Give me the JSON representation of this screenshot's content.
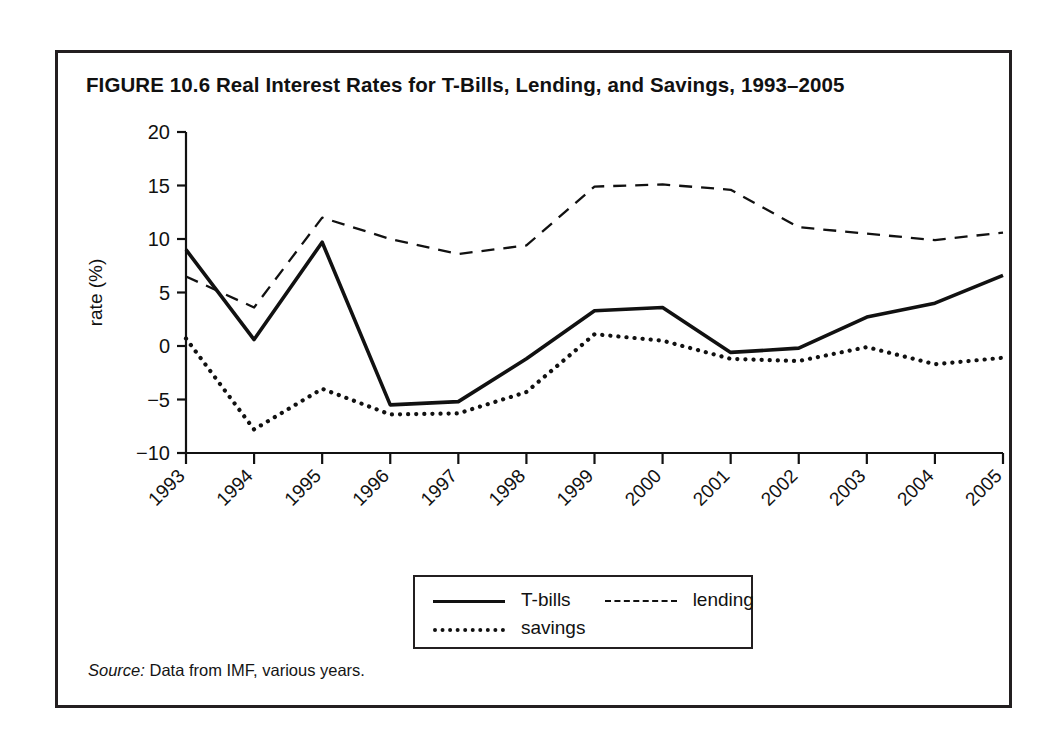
{
  "figure": {
    "title": "FIGURE 10.6  Real Interest Rates for T-Bills, Lending, and Savings, 1993–2005",
    "source_lead": "Source:",
    "source_text": " Data from IMF, various years."
  },
  "legend": {
    "items": [
      {
        "label": "T-bills",
        "style": "solid"
      },
      {
        "label": "lending",
        "style": "dashed"
      },
      {
        "label": "savings",
        "style": "dotted"
      }
    ]
  },
  "axes": {
    "y_title": "rate (%)",
    "x_title": "year",
    "y_ticks": [
      "20",
      "15",
      "10",
      "5",
      "0",
      "−5",
      "−10"
    ],
    "x_ticks": [
      "1993",
      "1994",
      "1995",
      "1996",
      "1997",
      "1998",
      "1999",
      "2000",
      "2001",
      "2002",
      "2003",
      "2004",
      "2005"
    ]
  },
  "colors": {
    "line": "#111111",
    "frame": "#231f20",
    "background": "#ffffff"
  },
  "chart_data": {
    "type": "line",
    "title": "FIGURE 10.6  Real Interest Rates for T-Bills, Lending, and Savings, 1993–2005",
    "xlabel": "year",
    "ylabel": "rate (%)",
    "categories": [
      "1993",
      "1994",
      "1995",
      "1996",
      "1997",
      "1998",
      "1999",
      "2000",
      "2001",
      "2002",
      "2003",
      "2004",
      "2005"
    ],
    "x": [
      1993,
      1994,
      1995,
      1996,
      1997,
      1998,
      1999,
      2000,
      2001,
      2002,
      2003,
      2004,
      2005
    ],
    "ylim": [
      -10,
      20
    ],
    "yticks": [
      -10,
      -5,
      0,
      5,
      10,
      15,
      20
    ],
    "grid": false,
    "legend_position": "below-plot",
    "series": [
      {
        "name": "T-bills",
        "style": "solid",
        "values": [
          9.0,
          0.6,
          9.7,
          -5.5,
          -5.2,
          -1.2,
          3.3,
          3.6,
          -0.6,
          -0.2,
          2.7,
          4.0,
          6.6
        ]
      },
      {
        "name": "lending",
        "style": "dashed",
        "values": [
          6.5,
          3.6,
          12.0,
          10.0,
          8.6,
          9.4,
          14.9,
          15.1,
          14.6,
          11.1,
          10.5,
          9.9,
          10.6
        ]
      },
      {
        "name": "savings",
        "style": "dotted",
        "values": [
          0.7,
          -7.8,
          -4.0,
          -6.4,
          -6.3,
          -4.3,
          1.1,
          0.5,
          -1.2,
          -1.4,
          -0.1,
          -1.7,
          -1.1
        ]
      }
    ],
    "source": "Source: Data from IMF, various years."
  }
}
